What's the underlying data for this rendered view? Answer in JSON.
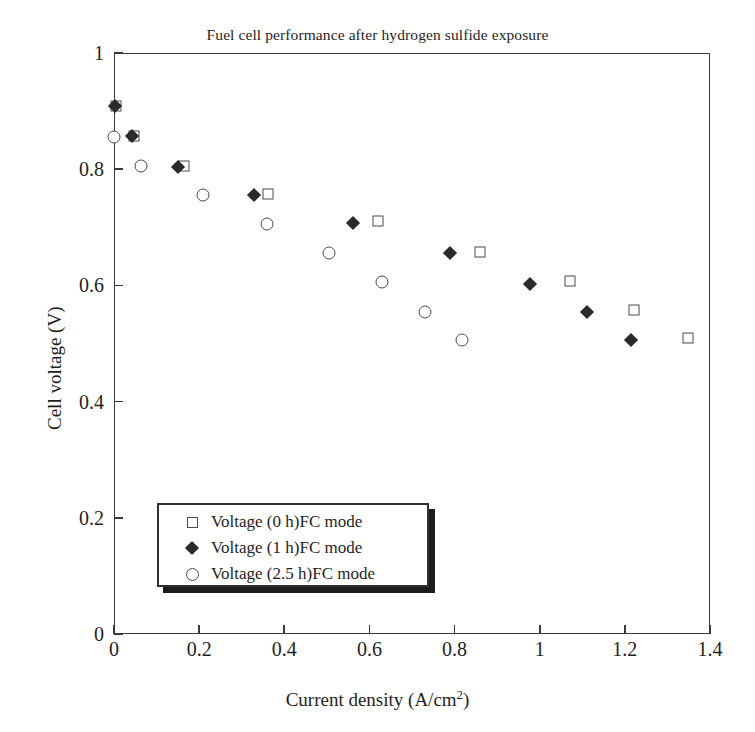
{
  "chart_data": {
    "type": "scatter",
    "title": "Fuel cell performance after hydrogen sulfide exposure",
    "xlabel": "Current density (A/cm2)",
    "xlabel_base": "Current density (A/cm",
    "xlabel_sup": "2",
    "xlabel_tail": ")",
    "ylabel": "Cell voltage (V)",
    "xlim": [
      0,
      1.4
    ],
    "ylim": [
      0,
      1
    ],
    "xticks": [
      0,
      0.2,
      0.4,
      0.6,
      0.8,
      1,
      1.2,
      1.4
    ],
    "xticklabels": [
      "0",
      "0.2",
      "0.4",
      "0.6",
      "0.8",
      "1",
      "1.2",
      "1.4"
    ],
    "yticks": [
      0,
      0.2,
      0.4,
      0.6,
      0.8,
      1
    ],
    "yticklabels": [
      "0",
      "0.2",
      "0.4",
      "0.6",
      "0.8",
      "1"
    ],
    "grid": false,
    "legend_position": "lower-left-inside",
    "series": [
      {
        "name": "Voltage (0 h)FC mode",
        "marker": "open-square",
        "color": "#4a4a4a",
        "points": [
          [
            0.005,
            0.908
          ],
          [
            0.048,
            0.857
          ],
          [
            0.165,
            0.806
          ],
          [
            0.362,
            0.757
          ],
          [
            0.62,
            0.71
          ],
          [
            0.86,
            0.657
          ],
          [
            1.07,
            0.608
          ],
          [
            1.222,
            0.558
          ],
          [
            1.348,
            0.51
          ]
        ]
      },
      {
        "name": "Voltage (1 h)FC mode",
        "marker": "filled-diamond",
        "color": "#2b2b2b",
        "points": [
          [
            0.002,
            0.908
          ],
          [
            0.043,
            0.857
          ],
          [
            0.15,
            0.803
          ],
          [
            0.33,
            0.755
          ],
          [
            0.562,
            0.707
          ],
          [
            0.79,
            0.655
          ],
          [
            0.978,
            0.603
          ],
          [
            1.112,
            0.554
          ],
          [
            1.215,
            0.506
          ]
        ]
      },
      {
        "name": "Voltage (2.5 h)FC mode",
        "marker": "open-circle",
        "color": "#4a4a4a",
        "points": [
          [
            0.0,
            0.855
          ],
          [
            0.063,
            0.805
          ],
          [
            0.21,
            0.755
          ],
          [
            0.36,
            0.706
          ],
          [
            0.505,
            0.655
          ],
          [
            0.63,
            0.605
          ],
          [
            0.73,
            0.555
          ],
          [
            0.818,
            0.506
          ]
        ]
      }
    ]
  }
}
